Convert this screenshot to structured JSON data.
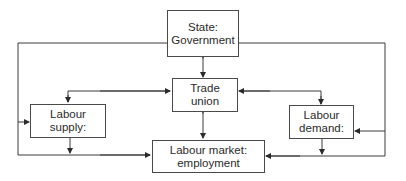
{
  "diagram": {
    "nodes": {
      "state": {
        "line1": "State:",
        "line2": "Government"
      },
      "trade_union": {
        "line1": "Trade",
        "line2": "union"
      },
      "labour_supply": {
        "line1": "Labour",
        "line2": "supply:"
      },
      "labour_demand": {
        "line1": "Labour",
        "line2": "demand:"
      },
      "labour_market": {
        "line1": "Labour market:",
        "line2": "employment"
      }
    },
    "edges": [
      {
        "from": "state",
        "to": "trade_union",
        "type": "bidirectional"
      },
      {
        "from": "trade_union",
        "to": "labour_market",
        "type": "bidirectional"
      },
      {
        "from": "trade_union",
        "to": "labour_supply",
        "type": "bidirectional"
      },
      {
        "from": "trade_union",
        "to": "labour_demand",
        "type": "bidirectional"
      },
      {
        "from": "labour_supply",
        "to": "labour_market",
        "type": "directed"
      },
      {
        "from": "labour_demand",
        "to": "labour_market",
        "type": "directed"
      },
      {
        "from": "state",
        "to": "labour_supply",
        "type": "directed"
      },
      {
        "from": "state",
        "to": "labour_demand",
        "type": "directed"
      },
      {
        "from": "state",
        "to": "labour_market",
        "type": "directed"
      }
    ],
    "colors": {
      "line": "#3a3a3a",
      "box_border": "#4a4a4a",
      "text": "#2a2a2a",
      "background": "#ffffff"
    }
  }
}
